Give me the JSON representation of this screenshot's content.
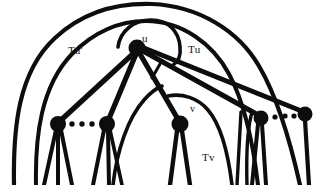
{
  "figure": {
    "kind": "hand-drawn-graph-diagram",
    "title": "",
    "background_color": "#ffffff",
    "ink_color": "#0d0d0d",
    "width": 317,
    "height": 185,
    "labels": [
      {
        "id": "u",
        "text": "u",
        "x": 142,
        "y": 33,
        "role": "vertex-label"
      },
      {
        "id": "tup",
        "text": "Tu'",
        "x": 68,
        "y": 45,
        "role": "region-label"
      },
      {
        "id": "tu",
        "text": "Tu",
        "x": 188,
        "y": 44,
        "role": "region-label"
      },
      {
        "id": "v",
        "text": "v",
        "x": 190,
        "y": 104,
        "role": "vertex-label"
      },
      {
        "id": "tv",
        "text": "Tv",
        "x": 202,
        "y": 152,
        "role": "region-label"
      }
    ],
    "vertices": [
      {
        "id": "u",
        "label": "u",
        "x": 137,
        "y": 48,
        "r": 8.5
      },
      {
        "id": "c1",
        "label": "",
        "x": 58,
        "y": 124,
        "r": 8.0
      },
      {
        "id": "c2",
        "label": "",
        "x": 107,
        "y": 124,
        "r": 8.0
      },
      {
        "id": "v",
        "label": "v",
        "x": 180,
        "y": 124,
        "r": 8.5
      },
      {
        "id": "c4",
        "label": "",
        "x": 261,
        "y": 118,
        "r": 7.5
      },
      {
        "id": "c5",
        "label": "",
        "x": 305,
        "y": 114,
        "r": 7.5
      }
    ],
    "edges": [
      {
        "from": "u",
        "to": "c1"
      },
      {
        "from": "u",
        "to": "c2"
      },
      {
        "from": "u",
        "to": "v"
      },
      {
        "from": "u",
        "to": "c4"
      },
      {
        "from": "u",
        "to": "c5"
      }
    ],
    "ellipsis_groups": [
      {
        "id": "left-ellipsis",
        "between": [
          "c1",
          "c2"
        ],
        "count": 3
      },
      {
        "id": "right-ellipsis",
        "between": [
          "c4",
          "c5"
        ],
        "count": 3
      }
    ],
    "tick_marks": [
      {
        "id": "edge-tick",
        "near_edge": "u-v",
        "x": 156,
        "y": 70
      }
    ],
    "arcs": [
      {
        "id": "arc-outer-tu",
        "encloses": "Tu",
        "note": "largest outer arc spanning whole drawing"
      },
      {
        "id": "arc-inner-tup",
        "encloses": "Tu'",
        "note": "second arc nested inside outer arc"
      },
      {
        "id": "arc-u-right",
        "encloses": "u",
        "note": "small arc curling right of u"
      },
      {
        "id": "arc-tv",
        "encloses": "Tv",
        "note": "arc enclosing subtree rooted at v"
      },
      {
        "id": "arc-mid-left",
        "encloses": "",
        "note": "arc rising from bottom left of v"
      }
    ],
    "leaf_legs": [
      {
        "parent": "c1",
        "count": 3
      },
      {
        "parent": "c2",
        "count": 3
      },
      {
        "parent": "v",
        "count": 2
      },
      {
        "parent": "c4",
        "count": 3
      },
      {
        "parent": "c5",
        "count": 1
      }
    ]
  }
}
